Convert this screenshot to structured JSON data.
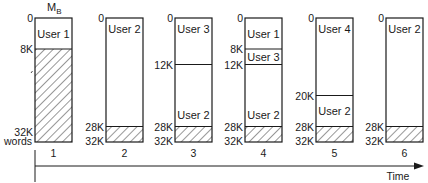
{
  "diagram": {
    "title_main": "M",
    "title_sub": "B",
    "memory_size_label": "32K",
    "memory_unit_label": "words",
    "time_label": "Time",
    "hatch_color": "#1a1a1a",
    "line_color": "#1a1a1a",
    "snapshots": [
      {
        "step": "1",
        "regions": [
          {
            "start": 0,
            "end": 8,
            "label": "User 1",
            "hatched": false,
            "start_label": "0"
          },
          {
            "start": 8,
            "end": 32,
            "label": "",
            "hatched": true,
            "start_label": "8K"
          }
        ],
        "end_label": "32K"
      },
      {
        "step": "2",
        "regions": [
          {
            "start": 0,
            "end": 28,
            "label": "User 2",
            "label_pos": "top",
            "hatched": false,
            "start_label": "0"
          },
          {
            "start": 28,
            "end": 32,
            "label": "",
            "hatched": true,
            "start_label": "28K"
          }
        ],
        "end_label": "32K"
      },
      {
        "step": "3",
        "regions": [
          {
            "start": 0,
            "end": 12,
            "label": "User 3",
            "label_pos": "top",
            "hatched": false,
            "start_label": "0"
          },
          {
            "start": 12,
            "end": 28,
            "label": "User 2",
            "label_pos": "bottom",
            "hatched": false,
            "start_label": "12K"
          },
          {
            "start": 28,
            "end": 32,
            "label": "",
            "hatched": true,
            "start_label": "28K"
          }
        ],
        "end_label": "32K"
      },
      {
        "step": "4",
        "regions": [
          {
            "start": 0,
            "end": 8,
            "label": "User 1",
            "label_pos": "top",
            "hatched": false,
            "start_label": "0"
          },
          {
            "start": 8,
            "end": 12,
            "label": "User 3",
            "label_pos": "top",
            "hatched": false,
            "start_label": "8K"
          },
          {
            "start": 12,
            "end": 28,
            "label": "User 2",
            "label_pos": "bottom",
            "hatched": false,
            "start_label": "12K"
          },
          {
            "start": 28,
            "end": 32,
            "label": "",
            "hatched": true,
            "start_label": "28K"
          }
        ],
        "end_label": "32K"
      },
      {
        "step": "5",
        "regions": [
          {
            "start": 0,
            "end": 20,
            "label": "User 4",
            "label_pos": "top",
            "hatched": false,
            "start_label": "0"
          },
          {
            "start": 20,
            "end": 28,
            "label": "User 2",
            "label_pos": "top",
            "hatched": false,
            "start_label": "20K"
          },
          {
            "start": 28,
            "end": 32,
            "label": "",
            "hatched": true,
            "start_label": "28K"
          }
        ],
        "end_label": "32K"
      },
      {
        "step": "6",
        "regions": [
          {
            "start": 0,
            "end": 28,
            "label": "User 2",
            "label_pos": "top",
            "hatched": false,
            "start_label": "0"
          },
          {
            "start": 28,
            "end": 32,
            "label": "",
            "hatched": true,
            "start_label": "28K"
          }
        ],
        "end_label": "32K"
      }
    ]
  }
}
